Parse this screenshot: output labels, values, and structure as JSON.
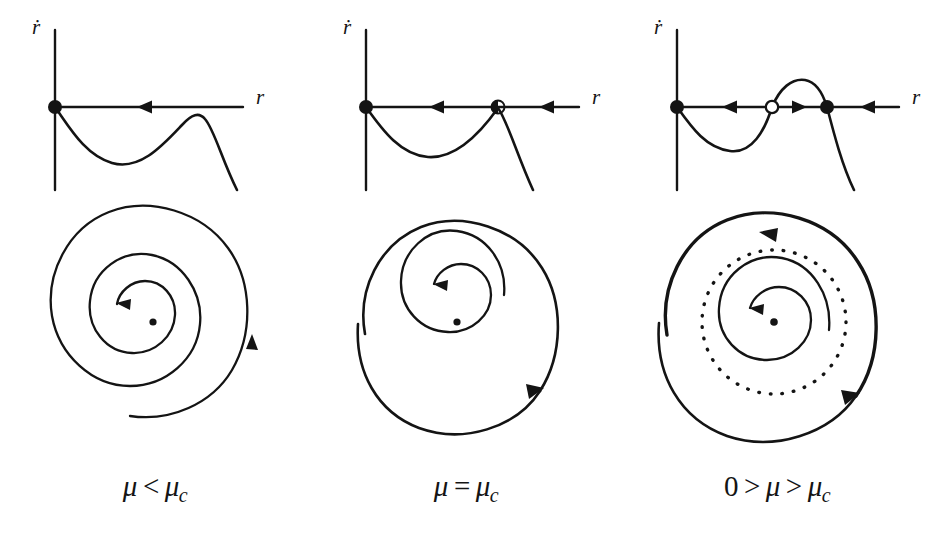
{
  "figure": {
    "background_color": "#ffffff",
    "ink_color": "#141414"
  },
  "panels": [
    {
      "id": "panel-1",
      "caption": {
        "lhs": "μ",
        "relation": "<",
        "rhs": "μ",
        "rhs_sub": "c"
      },
      "graph": {
        "yaxis_label": "ṙ",
        "xaxis_label": "r",
        "fixed_points": [
          {
            "name": "origin",
            "type": "stable",
            "marker": "filled-circle",
            "x": 55,
            "y": 107
          }
        ],
        "flow_arrows": [
          {
            "direction": "left",
            "x": 142,
            "y": 107
          }
        ],
        "curve_description": "rdot dips below axis from origin, local minimum, rises to local maximum below axis, then falls steeply"
      },
      "portrait": {
        "center_marker": "filled-dot",
        "inner_spiral_arrow": "counterclockwise-inward",
        "outer_spiral_arrow": "counterclockwise-inward",
        "limit_cycles": []
      }
    },
    {
      "id": "panel-2",
      "caption": {
        "lhs": "μ",
        "relation": "=",
        "rhs": "μ",
        "rhs_sub": "c"
      },
      "graph": {
        "yaxis_label": "ṙ",
        "xaxis_label": "r",
        "fixed_points": [
          {
            "name": "origin",
            "type": "stable",
            "marker": "filled-circle",
            "x": 55,
            "y": 107
          },
          {
            "name": "semistable",
            "type": "half-stable",
            "marker": "half-filled-circle",
            "x": 187,
            "y": 107
          }
        ],
        "flow_arrows": [
          {
            "direction": "left",
            "x": 123,
            "y": 107
          },
          {
            "direction": "left",
            "x": 232,
            "y": 107
          }
        ],
        "curve_description": "rdot dips below axis from origin and rises tangentially to touch axis at the semi-stable point, then falls steeply"
      },
      "portrait": {
        "center_marker": "filled-dot",
        "inner_spiral_arrow": "counterclockwise-inward",
        "outer_spiral_arrow": "counterclockwise-inward",
        "limit_cycles": [
          {
            "type": "semistable",
            "style": "solid"
          }
        ]
      }
    },
    {
      "id": "panel-3",
      "caption": {
        "zero": "0",
        "relation_1": ">",
        "lhs": "μ",
        "relation_2": ">",
        "rhs": "μ",
        "rhs_sub": "c"
      },
      "graph": {
        "yaxis_label": "ṙ",
        "xaxis_label": "r",
        "fixed_points": [
          {
            "name": "origin",
            "type": "stable",
            "marker": "filled-circle",
            "x": 55,
            "y": 107
          },
          {
            "name": "unstable",
            "type": "unstable",
            "marker": "open-circle",
            "x": 150,
            "y": 107
          },
          {
            "name": "stable-outer",
            "type": "stable",
            "marker": "filled-circle",
            "x": 205,
            "y": 107
          }
        ],
        "flow_arrows": [
          {
            "direction": "left",
            "x": 105,
            "y": 107
          },
          {
            "direction": "right",
            "x": 178,
            "y": 107
          },
          {
            "direction": "left",
            "x": 250,
            "y": 107
          }
        ],
        "curve_description": "rdot dips below axis, crosses upward at unstable point, peaks above axis, crosses downward at stable point, then falls steeply"
      },
      "portrait": {
        "center_marker": "filled-dot",
        "inner_spiral_arrow": "counterclockwise-inward",
        "outer_spiral_arrow": "counterclockwise-inward",
        "limit_cycles": [
          {
            "type": "unstable",
            "style": "dotted"
          },
          {
            "type": "stable",
            "style": "solid-bold",
            "arrow": "counterclockwise"
          }
        ]
      }
    }
  ]
}
